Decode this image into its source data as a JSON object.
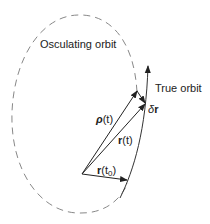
{
  "diagram": {
    "labels": {
      "osculating_orbit": "Osculating orbit",
      "true_orbit": "True orbit"
    },
    "vectors": {
      "rho": {
        "symbol": "ρ",
        "arg": "(t)"
      },
      "r_t": {
        "symbol": "r",
        "arg": "(t)"
      },
      "r_t0": {
        "symbol": "r",
        "arg_open": "(t",
        "sub": "0",
        "arg_close": ")"
      },
      "delta_r": {
        "prefix": "δ",
        "symbol": "r"
      }
    },
    "colors": {
      "line": "#222222",
      "dashed_orbit": "#888888"
    }
  }
}
